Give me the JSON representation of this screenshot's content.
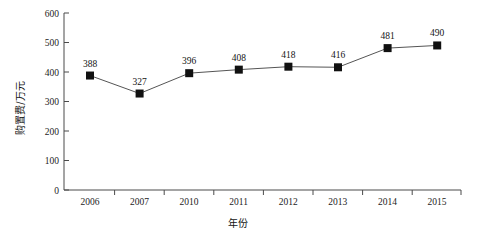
{
  "chart_data": {
    "type": "line",
    "title": "",
    "xlabel": "年份",
    "ylabel": "购置费/万元",
    "categories": [
      "2006",
      "2007",
      "2010",
      "2011",
      "2012",
      "2013",
      "2014",
      "2015"
    ],
    "values": [
      388,
      327,
      396,
      408,
      418,
      416,
      481,
      490
    ],
    "series": [
      {
        "name": "购置费",
        "values": [
          388,
          327,
          396,
          408,
          418,
          416,
          481,
          490
        ]
      }
    ],
    "point_labels": [
      "388",
      "327",
      "396",
      "408",
      "418",
      "416",
      "481",
      "490"
    ],
    "ylim": [
      0,
      600
    ],
    "yticks": [
      0,
      100,
      200,
      300,
      400,
      500,
      600
    ],
    "ytick_labels": [
      "0",
      "100",
      "200",
      "300",
      "400",
      "500",
      "600"
    ],
    "grid": "off",
    "legend": "none",
    "marker": "square",
    "marker_color": "#111111",
    "line_color": "#555555",
    "axis_color": "#4a4a4a",
    "background": "#ffffff"
  },
  "axis": {
    "x_title": "年份",
    "y_title": "购置费/万元"
  },
  "y_ticks": [
    {
      "label": "600"
    },
    {
      "label": "500"
    },
    {
      "label": "400"
    },
    {
      "label": "300"
    },
    {
      "label": "200"
    },
    {
      "label": "100"
    },
    {
      "label": "0"
    }
  ],
  "x_ticks": [
    {
      "label": "2006"
    },
    {
      "label": "2007"
    },
    {
      "label": "2010"
    },
    {
      "label": "2011"
    },
    {
      "label": "2012"
    },
    {
      "label": "2013"
    },
    {
      "label": "2014"
    },
    {
      "label": "2015"
    }
  ],
  "points": [
    {
      "category": "2006",
      "value": 388,
      "label": "388"
    },
    {
      "category": "2007",
      "value": 327,
      "label": "327"
    },
    {
      "category": "2010",
      "value": 396,
      "label": "396"
    },
    {
      "category": "2011",
      "value": 408,
      "label": "408"
    },
    {
      "category": "2012",
      "value": 418,
      "label": "418"
    },
    {
      "category": "2013",
      "value": 416,
      "label": "416"
    },
    {
      "category": "2014",
      "value": 481,
      "label": "481"
    },
    {
      "category": "2015",
      "value": 490,
      "label": "490"
    }
  ],
  "caption": {
    "partial_text": ""
  }
}
